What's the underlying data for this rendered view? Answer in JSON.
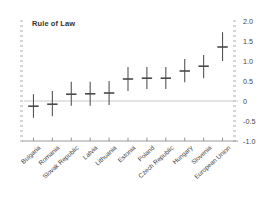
{
  "chart_data": {
    "type": "scatter",
    "title": "Rule of Law",
    "xlabel": "",
    "ylabel": "",
    "ylim": [
      -1.0,
      2.0
    ],
    "ytick_labels": [
      "2.0",
      "1.5",
      "1.0",
      "0.5",
      "0",
      "-0.5",
      "-1.0"
    ],
    "ytick_values": [
      2.0,
      1.5,
      1.0,
      0.5,
      0,
      -0.5,
      -1.0
    ],
    "grid": false,
    "zero_line": true,
    "legend": "none",
    "marker": "cross-with-error-bar",
    "categories": [
      "Bulgaria",
      "Romania",
      "Slovak Republic",
      "Latvia",
      "Lithuania",
      "Estonia",
      "Poland",
      "Czech Republic",
      "Hungary",
      "Slovenia",
      "European Union"
    ],
    "values": [
      -0.13,
      -0.08,
      0.17,
      0.18,
      0.2,
      0.55,
      0.57,
      0.57,
      0.75,
      0.87,
      1.35
    ],
    "error_low": [
      -0.42,
      -0.38,
      -0.12,
      -0.12,
      -0.1,
      0.25,
      0.3,
      0.3,
      0.47,
      0.57,
      1.0
    ],
    "error_high": [
      0.17,
      0.25,
      0.48,
      0.48,
      0.5,
      0.85,
      0.85,
      0.85,
      1.05,
      1.15,
      1.72
    ]
  }
}
